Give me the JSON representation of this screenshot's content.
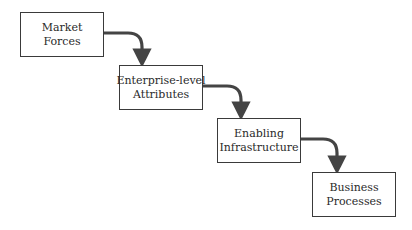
{
  "diagram": {
    "type": "staircase-flow",
    "stroke_color": "#444444",
    "boxes": [
      {
        "id": "market-forces",
        "line1": "Market",
        "line2": "Forces"
      },
      {
        "id": "enterprise-level-attributes",
        "line1": "Enterprise-level",
        "line2": "Attributes"
      },
      {
        "id": "enabling-infrastructure",
        "line1": "Enabling",
        "line2": "Infrastructure"
      },
      {
        "id": "business-processes",
        "line1": "Business",
        "line2": "Processes"
      }
    ],
    "edges": [
      {
        "from": "market-forces",
        "to": "enterprise-level-attributes"
      },
      {
        "from": "enterprise-level-attributes",
        "to": "enabling-infrastructure"
      },
      {
        "from": "enabling-infrastructure",
        "to": "business-processes"
      }
    ]
  }
}
